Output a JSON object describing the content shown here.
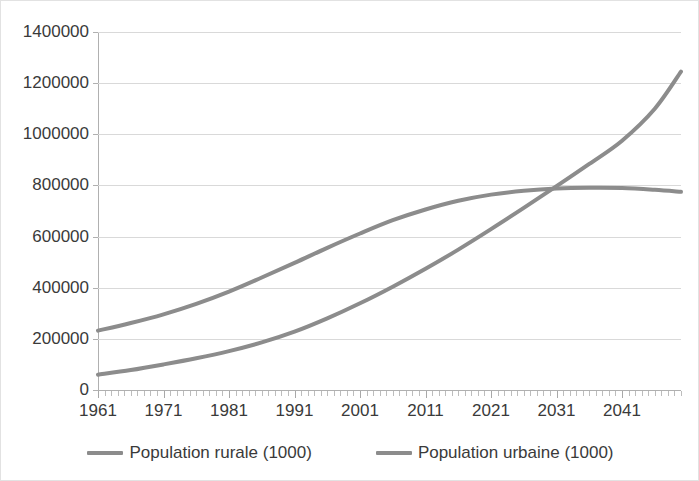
{
  "chart_data": {
    "type": "line",
    "title": "",
    "xlabel": "",
    "ylabel": "",
    "xlim": [
      1961,
      2050
    ],
    "ylim": [
      0,
      1400000
    ],
    "grid": true,
    "legend_position": "bottom",
    "y_ticks": [
      0,
      200000,
      400000,
      600000,
      800000,
      1000000,
      1200000,
      1400000
    ],
    "y_tick_labels": [
      "0",
      "200000",
      "400000",
      "600000",
      "800000",
      "1000000",
      "1200000",
      "1400000"
    ],
    "x_ticks": [
      1961,
      1971,
      1981,
      1991,
      2001,
      2011,
      2021,
      2031,
      2041
    ],
    "x_tick_labels": [
      "1961",
      "1971",
      "1981",
      "1991",
      "2001",
      "2011",
      "2021",
      "2031",
      "2041"
    ],
    "x_minor_tick_interval": 1,
    "line_color": "#8c8c8c",
    "gridline_color": "#d9d9d9",
    "axis_color": "#b0b0b0",
    "x": [
      1961,
      1966,
      1971,
      1976,
      1981,
      1986,
      1991,
      1996,
      2001,
      2006,
      2011,
      2016,
      2021,
      2026,
      2031,
      2036,
      2041,
      2046,
      2050
    ],
    "series": [
      {
        "name": "Population rurale (1000)",
        "color": "#8c8c8c",
        "values": [
          232000,
          262000,
          296000,
          337000,
          385000,
          440000,
          497000,
          556000,
          612000,
          664000,
          706000,
          740000,
          764000,
          779000,
          788000,
          791000,
          790000,
          783000,
          775000
        ]
      },
      {
        "name": "Population urbaine (1000)",
        "color": "#8c8c8c",
        "values": [
          60000,
          78000,
          100000,
          124000,
          152000,
          186000,
          228000,
          280000,
          339000,
          404000,
          474000,
          549000,
          629000,
          712000,
          797000,
          884000,
          975000,
          1100000,
          1245000
        ]
      }
    ],
    "annotations": [
      {
        "label": "crossover",
        "x": 2029,
        "y": 762000
      }
    ]
  },
  "legend": {
    "entries": [
      {
        "label": "Population rurale (1000)"
      },
      {
        "label": "Population urbaine (1000)"
      }
    ]
  }
}
